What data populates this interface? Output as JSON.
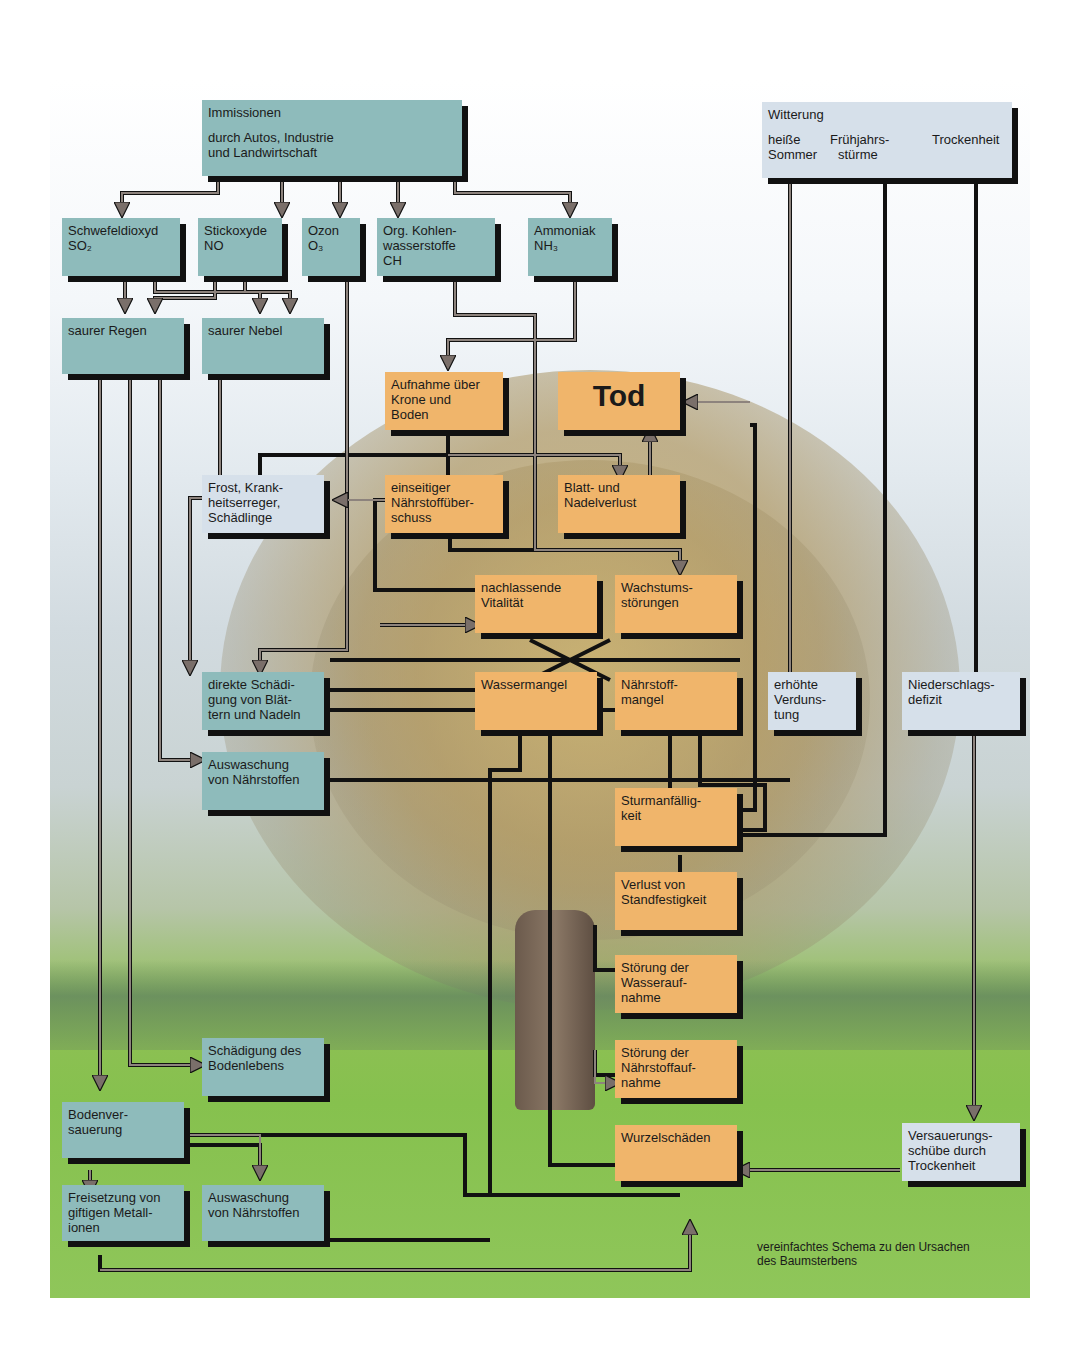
{
  "diagram": {
    "caption": [
      "vereinfachtes Schema zu den Ursachen",
      "des Baumsterbens"
    ],
    "nodes": {
      "immissionen": {
        "lines": [
          "Immissionen",
          "",
          "durch Autos, Industrie",
          "und Landwirtschaft"
        ]
      },
      "witterung": {
        "title": "Witterung",
        "col1": [
          "heiße",
          "Sommer"
        ],
        "col2": [
          "Frühjahrs-",
          "stürme"
        ],
        "col3": [
          "Trockenheit"
        ]
      },
      "schwefeldioxyd": {
        "lines": [
          "Schwefeldioxyd",
          "SO₂"
        ]
      },
      "stickoxyde": {
        "lines": [
          "Stickoxyde",
          "NO"
        ]
      },
      "ozon": {
        "lines": [
          "Ozon",
          "O₃"
        ]
      },
      "kohlenwasserstoffe": {
        "lines": [
          "Org. Kohlen-",
          "wasserstoffe",
          "CH"
        ]
      },
      "ammoniak": {
        "lines": [
          "Ammoniak",
          "NH₃"
        ]
      },
      "saurer_regen": {
        "lines": [
          "saurer Regen"
        ]
      },
      "saurer_nebel": {
        "lines": [
          "saurer Nebel"
        ]
      },
      "aufnahme": {
        "lines": [
          "Aufnahme über",
          "Krone und",
          "Boden"
        ]
      },
      "tod": {
        "lines": [
          "Tod"
        ]
      },
      "frost": {
        "lines": [
          "Frost, Krank-",
          "heitserreger,",
          "Schädlinge"
        ]
      },
      "naehrstoffueberschuss": {
        "lines": [
          "einseitiger",
          "Nährstoffüber-",
          "schuss"
        ]
      },
      "blattverlust": {
        "lines": [
          "Blatt- und",
          "Nadelverlust"
        ]
      },
      "vitalitaet": {
        "lines": [
          "nachlassende",
          "Vitalität"
        ]
      },
      "wachstum": {
        "lines": [
          "Wachstums-",
          "störungen"
        ]
      },
      "direkte_schaedigung": {
        "lines": [
          "direkte Schädi-",
          "gung von Blät-",
          "tern und Nadeln"
        ]
      },
      "wassermangel": {
        "lines": [
          "Wassermangel"
        ]
      },
      "naehrstoffmangel": {
        "lines": [
          "Nährstoff-",
          "mangel"
        ]
      },
      "verdunstung": {
        "lines": [
          "erhöhte",
          "Verduns-",
          "tung"
        ]
      },
      "niederschlag": {
        "lines": [
          "Niederschlags-",
          "defizit"
        ]
      },
      "auswaschung_1": {
        "lines": [
          "Auswaschung",
          "von Nährstoffen"
        ]
      },
      "sturm": {
        "lines": [
          "Sturmanfällig-",
          "keit"
        ]
      },
      "standfestigkeit": {
        "lines": [
          "Verlust von",
          "Standfestigkeit"
        ]
      },
      "wasseraufnahme": {
        "lines": [
          "Störung der",
          "Wasserauf-",
          "nahme"
        ]
      },
      "bodenleben": {
        "lines": [
          "Schädigung des",
          "Bodenlebens"
        ]
      },
      "naehrstoffaufnahme": {
        "lines": [
          "Störung der",
          "Nährstoffauf-",
          "nahme"
        ]
      },
      "bodenversauerung": {
        "lines": [
          "Bodenver-",
          "sauerung"
        ]
      },
      "wurzelschaeden": {
        "lines": [
          "Wurzelschäden"
        ]
      },
      "versauerungsschuebe": {
        "lines": [
          "Versauerungs-",
          "schübe durch",
          "Trockenheit"
        ]
      },
      "metallionen": {
        "lines": [
          "Freisetzung von",
          "giftigen Metall-",
          "ionen"
        ]
      },
      "auswaschung_2": {
        "lines": [
          "Auswaschung",
          "von Nährstoffen"
        ]
      }
    },
    "colors": {
      "emission_box": "#8ebbbb",
      "effect_box": "#f0b56b",
      "weather_box": "#d6e0ea",
      "shadow": "#111111",
      "wire": "#7a6f6a"
    }
  }
}
